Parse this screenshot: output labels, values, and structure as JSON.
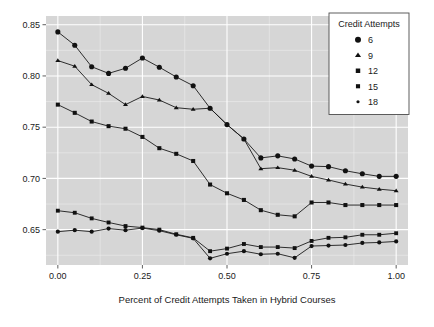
{
  "chart_data": {
    "type": "line",
    "title": "",
    "xlabel": "Percent of Credit Attempts Taken in Hybrid Courses",
    "ylabel": "",
    "xlim": [
      -0.035,
      1.035
    ],
    "ylim": [
      0.6155,
      0.8585
    ],
    "xticks": [
      0.0,
      0.25,
      0.5,
      0.75,
      1.0
    ],
    "xticklabels": [
      "0.00",
      "0.25",
      "0.50",
      "0.75",
      "1.00"
    ],
    "yticks": [
      0.65,
      0.7,
      0.75,
      0.8,
      0.85
    ],
    "yticklabels": [
      "0.65",
      "0.70",
      "0.75",
      "0.80",
      "0.85"
    ],
    "grid": true,
    "grid_color": "#ffffff",
    "panel_background": "#d6d6d6",
    "legend": {
      "title": "Credit Attempts",
      "position": "top-right",
      "entries": [
        {
          "label": "6",
          "marker": "circle",
          "marker_size": 3.0
        },
        {
          "label": "9",
          "marker": "triangle",
          "marker_size": 3.0
        },
        {
          "label": "12",
          "marker": "square",
          "marker_size": 2.6
        },
        {
          "label": "15",
          "marker": "square",
          "marker_size": 2.4
        },
        {
          "label": "18",
          "marker": "dot",
          "marker_size": 1.6
        }
      ]
    },
    "x": [
      0.0,
      0.05,
      0.1,
      0.15,
      0.2,
      0.25,
      0.3,
      0.35,
      0.4,
      0.45,
      0.5,
      0.55,
      0.6,
      0.65,
      0.7,
      0.75,
      0.8,
      0.85,
      0.9,
      0.95,
      1.0
    ],
    "series": [
      {
        "name": "6",
        "marker": "circle",
        "values": [
          0.843,
          0.83,
          0.809,
          0.8025,
          0.8075,
          0.8175,
          0.8085,
          0.799,
          0.7905,
          0.7685,
          0.7525,
          0.7385,
          0.72,
          0.722,
          0.719,
          0.712,
          0.7115,
          0.7075,
          0.7045,
          0.702,
          0.702
        ]
      },
      {
        "name": "9",
        "marker": "triangle",
        "values": [
          0.815,
          0.8095,
          0.7915,
          0.783,
          0.772,
          0.78,
          0.7765,
          0.769,
          0.7675,
          0.7685,
          0.7525,
          0.7385,
          0.7095,
          0.7105,
          0.708,
          0.702,
          0.6985,
          0.6945,
          0.6915,
          0.6895,
          0.688
        ]
      },
      {
        "name": "12",
        "marker": "square",
        "values": [
          0.772,
          0.764,
          0.7555,
          0.751,
          0.7485,
          0.7405,
          0.7295,
          0.724,
          0.717,
          0.694,
          0.6855,
          0.679,
          0.669,
          0.6645,
          0.663,
          0.6765,
          0.6765,
          0.674,
          0.674,
          0.674,
          0.674
        ]
      },
      {
        "name": "15",
        "marker": "square",
        "values": [
          0.6685,
          0.6665,
          0.661,
          0.657,
          0.6535,
          0.652,
          0.65,
          0.6455,
          0.642,
          0.629,
          0.6315,
          0.636,
          0.633,
          0.633,
          0.632,
          0.639,
          0.642,
          0.6425,
          0.645,
          0.645,
          0.6465
        ]
      },
      {
        "name": "18",
        "marker": "dot",
        "values": [
          0.648,
          0.6495,
          0.648,
          0.651,
          0.6495,
          0.6515,
          0.649,
          0.645,
          0.6415,
          0.622,
          0.6265,
          0.629,
          0.626,
          0.6265,
          0.6225,
          0.634,
          0.6345,
          0.635,
          0.637,
          0.6375,
          0.6385
        ]
      }
    ]
  }
}
